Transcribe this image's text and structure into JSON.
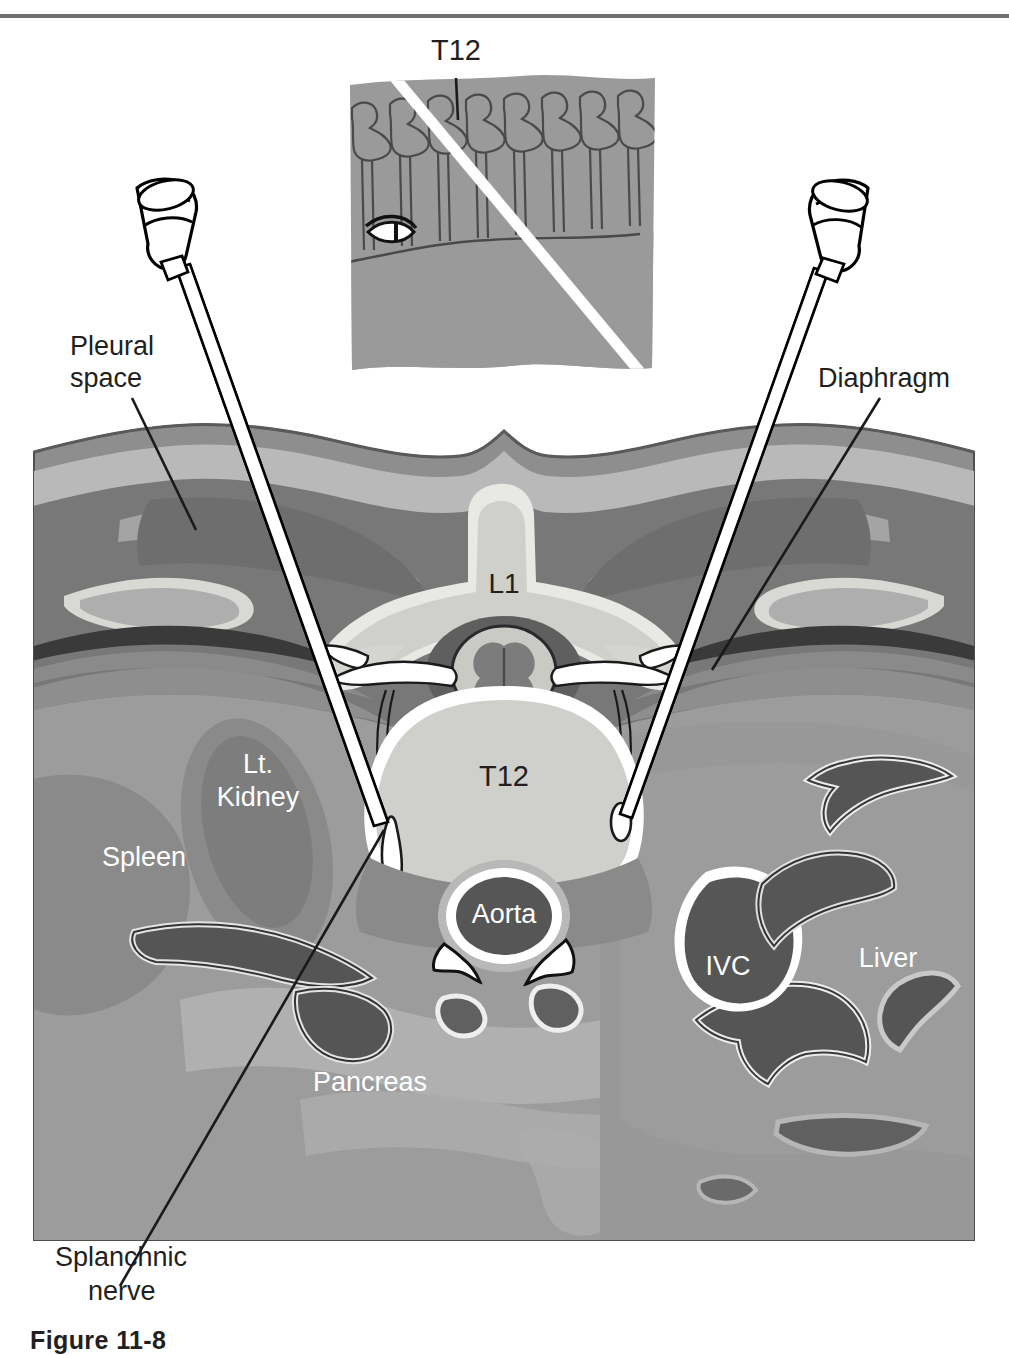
{
  "figure": {
    "type": "medical-illustration",
    "title_caption": "Figure 11-8",
    "modality": "axial cross-sectional anatomic diagram"
  },
  "top_rule": {
    "present": true,
    "color": "#6f7074"
  },
  "inset": {
    "name": "lateral-spine-inset",
    "label_t12": "T12",
    "eye_icon": "eye-icon",
    "needle_track_color": "#ffffff",
    "background_color": "#9a9a9a",
    "vertebra_count": 8
  },
  "labels": {
    "pleural_space": "Pleural\nspace",
    "pleural_space_line1": "Pleural",
    "pleural_space_line2": "space",
    "diaphragm": "Diaphragm",
    "splanchnic_nerve_line1": "Splanchnic",
    "splanchnic_nerve_line2": "nerve",
    "l1": "L1",
    "t12": "T12",
    "lt_kidney_line1": "Lt.",
    "lt_kidney_line2": "Kidney",
    "spleen": "Spleen",
    "aorta": "Aorta",
    "ivc": "IVC",
    "liver": "Liver",
    "pancreas": "Pancreas"
  },
  "needles": [
    {
      "name": "left-needle",
      "side": "left",
      "hub": "needle-hub",
      "angle_deg": 25,
      "target": "left splanchnic nerve at T12 body"
    },
    {
      "name": "right-needle",
      "side": "right",
      "hub": "needle-hub",
      "angle_deg": -22,
      "target": "right splanchnic nerve at T12 body"
    }
  ],
  "colors": {
    "skin": "#8e8e8e",
    "subcutaneous_fat": "#b9b9b9",
    "muscle": "#787878",
    "deep_muscle": "#6a6a6a",
    "bone_cortex": "#e8e8e4",
    "bone_marrow": "#cfcfcb",
    "viscera_mid": "#9c9c9c",
    "viscera_light": "#b0b0b0",
    "vessel_dark": "#5b5b5b",
    "vessel_darkest": "#4a4a4a",
    "pleural_line": "#3a3a3a",
    "outline_black": "#000000",
    "label_dark": "#231f20",
    "label_light": "#ffffff",
    "page_background": "#ffffff"
  },
  "structures": [
    "skin and subcutaneous fat",
    "paraspinal / erector spinae muscle",
    "rib",
    "pleural space",
    "diaphragm",
    "L1 spinous process and lamina",
    "spinal cord with butterfly gray matter",
    "spinal nerve roots and dorsal root ganglia",
    "T12 vertebral body",
    "splanchnic nerves",
    "aorta",
    "inferior vena cava",
    "left kidney",
    "spleen",
    "pancreas",
    "liver",
    "mesenteric / splenic vessels"
  ]
}
